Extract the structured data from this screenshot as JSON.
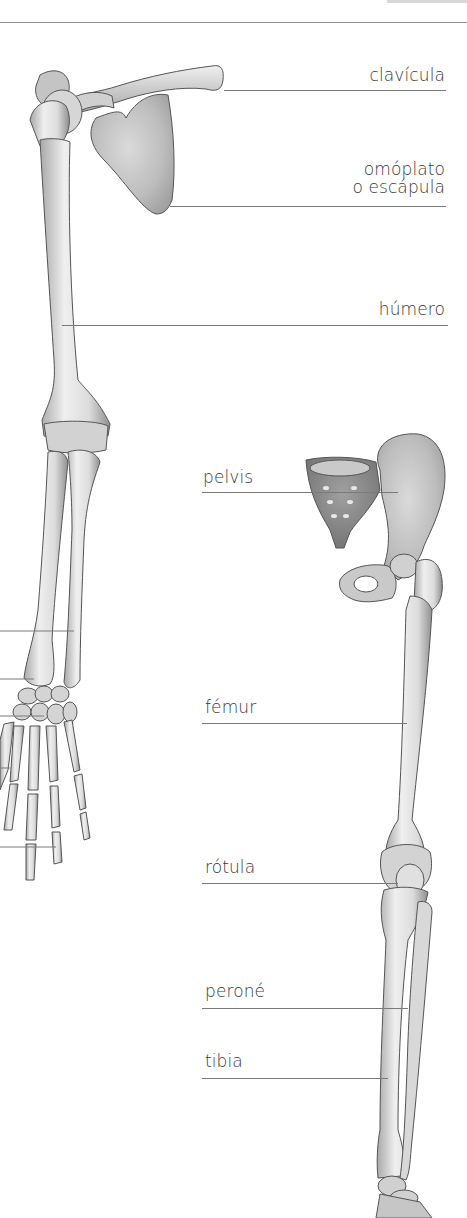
{
  "diagram": {
    "type": "anatomical-illustration",
    "colors": {
      "background": "#ffffff",
      "text": "#3a3a3a",
      "leader_line": "#7a7a7a",
      "bone_fill": "#e6e6e6",
      "bone_shadow": "#9a9a9a",
      "bone_outline": "#555555"
    }
  },
  "labels": {
    "clavicula": "clavícula",
    "omoplato_line1": "omóplato",
    "omoplato_line2": "o escápula",
    "humero": "húmero",
    "pelvis": "pelvis",
    "femur": "fémur",
    "rotula": "rótula",
    "perone": "peroné",
    "tibia": "tibia"
  },
  "cut_off_leaders_left": [
    631,
    679,
    716,
    768,
    847
  ]
}
